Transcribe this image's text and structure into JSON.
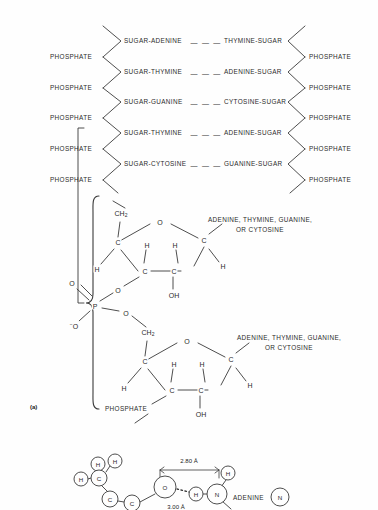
{
  "figure": {
    "panel_label": "(a)",
    "bond_dashes": "— — —"
  },
  "ladder": {
    "rows": [
      {
        "left_base": "SUGAR-ADENINE",
        "right_base": "THYMINE-SUGAR",
        "y": 41
      },
      {
        "left_base": "SUGAR-THYMINE",
        "right_base": "ADENINE-SUGAR",
        "y": 72
      },
      {
        "left_base": "SUGAR-GUANINE",
        "right_base": "CYTOSINE-SUGAR",
        "y": 102
      },
      {
        "left_base": "SUGAR-THYMINE",
        "right_base": "ADENINE-SUGAR",
        "y": 133
      },
      {
        "left_base": "SUGAR-CYTOSINE",
        "right_base": "GUANINE-SUGAR",
        "y": 164
      }
    ],
    "left_phosphates": [
      {
        "label": "PHOSPHATE",
        "y": 57
      },
      {
        "label": "PHOSPHATE",
        "y": 88
      },
      {
        "label": "PHOSPHATE",
        "y": 118
      },
      {
        "label": "PHOSPHATE",
        "y": 149
      },
      {
        "label": "PHOSPHATE",
        "y": 180
      }
    ],
    "right_phosphates": [
      {
        "label": "PHOSPHATE",
        "y": 57
      },
      {
        "label": "PHOSPHATE",
        "y": 88
      },
      {
        "label": "PHOSPHATE",
        "y": 118
      },
      {
        "label": "PHOSPHATE",
        "y": 149
      },
      {
        "label": "PHOSPHATE",
        "y": 180
      }
    ]
  },
  "nucleotide_upper": {
    "ch2": "CH",
    "ch2_sub": "2",
    "ring_oxygen": "O",
    "carbons": [
      "C",
      "C",
      "C",
      "C"
    ],
    "hydrogens": [
      "H",
      "H",
      "H",
      "H"
    ],
    "hydroxyl": "OH",
    "base_label_line1": "ADENINE, THYMINE, GUANINE,",
    "base_label_line2": "OR CYTOSINE"
  },
  "phosphate_group": {
    "phosphorus": "P",
    "double_bond_oxygen": "O",
    "anionic_oxygen": "O",
    "anionic_charge": "−",
    "ester_oxygen_top": "O",
    "ester_oxygen_bottom": "O"
  },
  "nucleotide_lower": {
    "ch2": "CH",
    "ch2_sub": "2",
    "ring_oxygen": "O",
    "carbons": [
      "C",
      "C",
      "C",
      "C"
    ],
    "hydrogens": [
      "H",
      "H",
      "H",
      "H"
    ],
    "hydroxyl": "OH",
    "phosphate_label": "PHOSPHATE",
    "base_label_line1": "ADENINE, THYMINE, GUANINE,",
    "base_label_line2": "OR CYTOSINE"
  },
  "base_pair_detail": {
    "distance_top": "2.80 Å",
    "distance_bottom": "3.00 Å",
    "base_name": "ADENINE",
    "atoms": [
      {
        "symbol": "H",
        "x": 81,
        "y": 479
      },
      {
        "symbol": "H",
        "x": 98,
        "y": 464
      },
      {
        "symbol": "H",
        "x": 115,
        "y": 461
      },
      {
        "symbol": "C",
        "x": 99,
        "y": 478
      },
      {
        "symbol": "C",
        "x": 110,
        "y": 499
      },
      {
        "symbol": "C",
        "x": 132,
        "y": 503
      },
      {
        "symbol": "O",
        "x": 165,
        "y": 487
      },
      {
        "symbol": "H",
        "x": 196,
        "y": 494
      },
      {
        "symbol": "N",
        "x": 217,
        "y": 494
      },
      {
        "symbol": "H",
        "x": 228,
        "y": 473
      },
      {
        "symbol": "N",
        "x": 280,
        "y": 497
      }
    ]
  }
}
